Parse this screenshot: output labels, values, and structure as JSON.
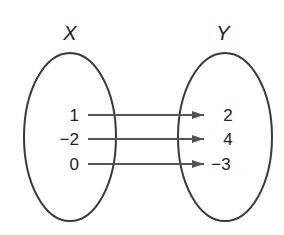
{
  "diagram": {
    "type": "mapping",
    "colors": {
      "ellipse": "#3a3a3a",
      "arrow": "#555555",
      "text": "#222222"
    },
    "sets": [
      {
        "name": "X",
        "elements": [
          "1",
          "−2",
          "0"
        ]
      },
      {
        "name": "Y",
        "elements": [
          "2",
          "4",
          "−3"
        ]
      }
    ],
    "mappings": [
      {
        "from": "1",
        "to": "2"
      },
      {
        "from": "−2",
        "to": "4"
      },
      {
        "from": "0",
        "to": "−3"
      }
    ]
  }
}
